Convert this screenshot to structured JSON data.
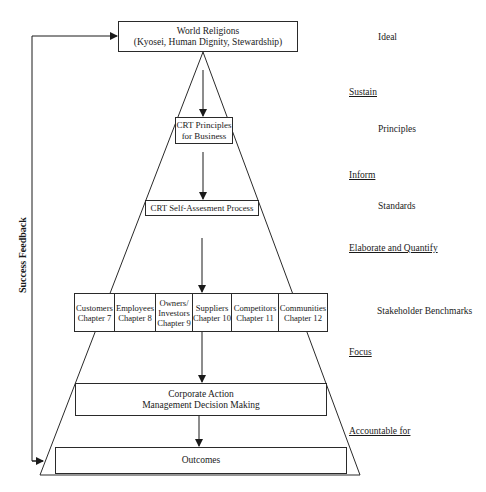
{
  "diagram": {
    "top_box": {
      "line1": "World Religions",
      "line2": "(Kyosei, Human Dignity, Stewardship)"
    },
    "principles_box": {
      "line1": "CRT Principles",
      "line2": "for Business"
    },
    "self_assessment_box": {
      "label": "CRT Self-Assesment Process"
    },
    "stakeholders": [
      {
        "line0": "",
        "line1": "Customers",
        "line2": "Chapter 7"
      },
      {
        "line0": "",
        "line1": "Employees",
        "line2": "Chapter 8"
      },
      {
        "line0": "Owners/",
        "line1": "Investors",
        "line2": "Chapter 9"
      },
      {
        "line0": "",
        "line1": "Suppliers",
        "line2": "Chapter 10"
      },
      {
        "line0": "",
        "line1": "Competitors",
        "line2": "Chapter 11"
      },
      {
        "line0": "",
        "line1": "Communities",
        "line2": "Chapter 12"
      }
    ],
    "corporate_action_box": {
      "line1": "Corporate Action",
      "line2": "Management Decision Making"
    },
    "outcomes_box": {
      "label": "Outcomes"
    },
    "feedback_label": "Success Feedback",
    "levels": {
      "ideal": "Ideal",
      "principles": "Principles",
      "standards": "Standards",
      "stakeholder_benchmarks": "Stakeholder Benchmarks"
    },
    "transitions": {
      "sustain": "Sustain",
      "inform": "Inform",
      "elaborate": "Elaborate and Quantify",
      "focus": "Focus",
      "accountable": "Accountable for"
    },
    "colors": {
      "line": "#2a2a2a",
      "background": "#ffffff",
      "text": "#1a1a1a"
    }
  }
}
